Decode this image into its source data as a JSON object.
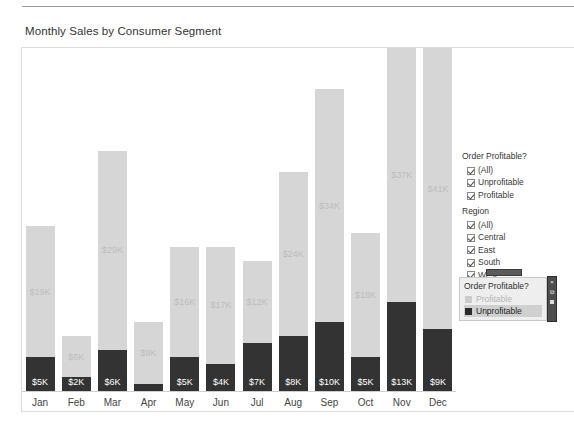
{
  "chart_title": "Monthly Sales by Consumer Segment",
  "chart_data": {
    "type": "bar",
    "stacked": true,
    "title": "Monthly Sales by Consumer Segment",
    "xlabel": "",
    "ylabel": "",
    "categories": [
      "Jan",
      "Feb",
      "Mar",
      "Apr",
      "May",
      "Jun",
      "Jul",
      "Aug",
      "Sep",
      "Oct",
      "Nov",
      "Dec"
    ],
    "series": [
      {
        "name": "Unprofitable",
        "color": "#333333",
        "values": [
          5,
          2,
          6,
          1,
          5,
          4,
          7,
          8,
          10,
          5,
          13,
          9
        ],
        "labels": [
          "$5K",
          "$2K",
          "$6K",
          "",
          "$5K",
          "$4K",
          "$7K",
          "$8K",
          "$10K",
          "$5K",
          "$13K",
          "$9K"
        ]
      },
      {
        "name": "Profitable",
        "color": "#d6d6d6",
        "values": [
          19,
          6,
          29,
          9,
          16,
          17,
          12,
          24,
          34,
          18,
          37,
          41
        ],
        "labels": [
          "$19K",
          "$6K",
          "$29K",
          "$9K",
          "$16K",
          "$17K",
          "$12K",
          "$24K",
          "$34K",
          "$18K",
          "$37K",
          "$41K"
        ]
      }
    ],
    "ylim": [
      0,
      50
    ],
    "grid": false,
    "legend_position": "right"
  },
  "filters": {
    "groups": [
      {
        "title": "Order Profitable?",
        "items": [
          {
            "label": "(All)",
            "checked": true
          },
          {
            "label": "Unprofitable",
            "checked": true
          },
          {
            "label": "Profitable",
            "checked": true
          }
        ]
      },
      {
        "title": "Region",
        "items": [
          {
            "label": "(All)",
            "checked": true
          },
          {
            "label": "Central",
            "checked": true
          },
          {
            "label": "East",
            "checked": true
          },
          {
            "label": "South",
            "checked": true
          },
          {
            "label": "West",
            "checked": true
          }
        ]
      }
    ]
  },
  "legend_card": {
    "title": "Order Profitable?",
    "items": [
      {
        "label": "Profitable",
        "state": "dim",
        "swatch": "#cccccc"
      },
      {
        "label": "Unprofitable",
        "state": "on",
        "swatch": "#2b2b2b"
      }
    ],
    "toolbar": {
      "close_icon": "×",
      "keep_only_icon": "⧉",
      "exclude_icon": "▪"
    }
  }
}
